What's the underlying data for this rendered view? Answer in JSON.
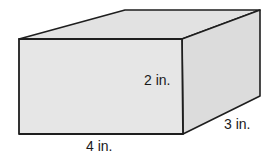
{
  "figure": {
    "type": "rectangular-prism",
    "colors": {
      "front_face": "#e6e6e6",
      "top_face": "#e2e2e2",
      "side_face": "#dcdcdc",
      "edge": "#1e1e1e",
      "text": "#1a1a1a"
    },
    "labels": {
      "length": "4 in.",
      "height": "2 in.",
      "depth": "3 in."
    }
  }
}
